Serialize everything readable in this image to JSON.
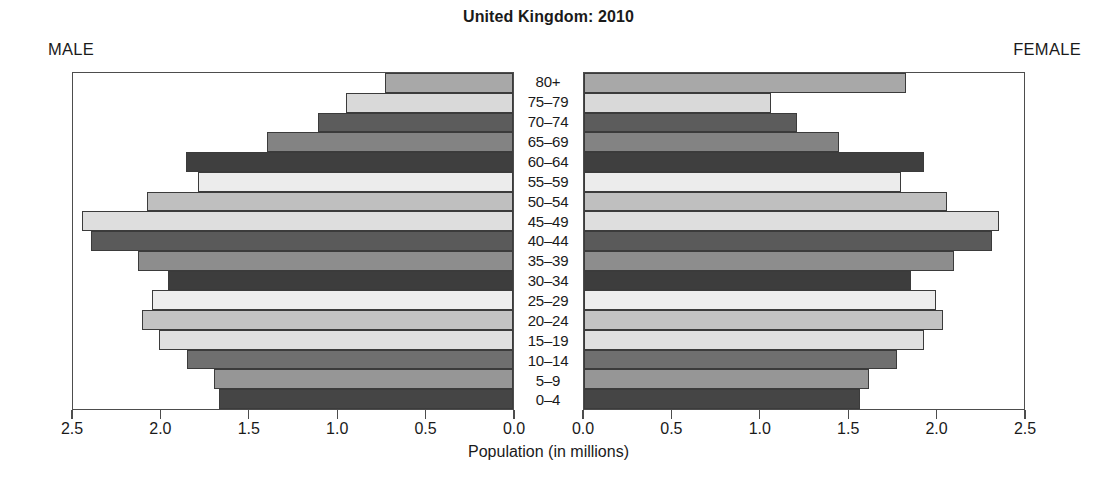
{
  "chart_data": {
    "type": "bar",
    "subtype": "population-pyramid",
    "title": "United Kingdom: 2010",
    "xlabel": "Population (in millions)",
    "ylabel": "",
    "grid": false,
    "legend_position": "none",
    "left_panel_label": "MALE",
    "right_panel_label": "FEMALE",
    "categories": [
      "80+",
      "75–79",
      "70–74",
      "65–69",
      "60–64",
      "55–59",
      "50–54",
      "45–49",
      "40–44",
      "35–39",
      "30–34",
      "25–29",
      "20–24",
      "15–19",
      "10–14",
      "5–9",
      "0–4"
    ],
    "xlim_left": [
      2.5,
      0.0
    ],
    "xlim_right": [
      0.0,
      2.5
    ],
    "xticks_left": [
      "2.5",
      "2.0",
      "1.5",
      "1.0",
      "0.5",
      "0.0"
    ],
    "xticks_right": [
      "0.0",
      "0.5",
      "1.0",
      "1.5",
      "2.0",
      "2.5"
    ],
    "xtick_values_left": [
      2.5,
      2.0,
      1.5,
      1.0,
      0.5,
      0.0
    ],
    "xtick_values_right": [
      0.0,
      0.5,
      1.0,
      1.5,
      2.0,
      2.5
    ],
    "axis_max": 2.5,
    "series": [
      {
        "name": "MALE",
        "side": "left",
        "values": [
          0.73,
          0.95,
          1.11,
          1.4,
          1.86,
          1.79,
          2.08,
          2.45,
          2.4,
          2.13,
          1.96,
          2.05,
          2.11,
          2.01,
          1.85,
          1.7,
          1.67
        ]
      },
      {
        "name": "FEMALE",
        "side": "right",
        "values": [
          1.83,
          1.06,
          1.21,
          1.45,
          1.93,
          1.8,
          2.06,
          2.36,
          2.32,
          2.1,
          1.86,
          2.0,
          2.04,
          1.93,
          1.78,
          1.62,
          1.57
        ]
      }
    ],
    "bar_colors": [
      "#a8a8a8",
      "#d9d9d9",
      "#5c5c5c",
      "#838383",
      "#3f3f3f",
      "#ececec",
      "#bfbfbf",
      "#dedede",
      "#5a5a5a",
      "#8d8d8d",
      "#3d3d3d",
      "#ededed",
      "#c4c4c4",
      "#e0e0e0",
      "#6f6f6f",
      "#969696",
      "#454545"
    ],
    "frame_color": "#4d4d4d",
    "bar_border_color": "#3b3b3b",
    "background_color": "#ffffff",
    "text_color": "#1a1a1a"
  }
}
